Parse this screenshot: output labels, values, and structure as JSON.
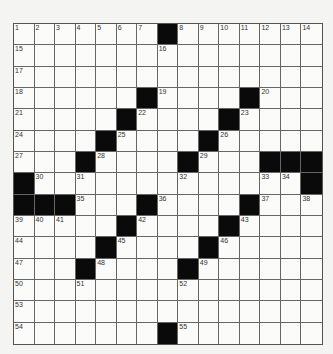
{
  "puzzle": {
    "rows": 15,
    "cols": 15,
    "colors": {
      "black": "#0a0a0a",
      "white": "#fbfbf9",
      "line": "#666666",
      "background": "#f4f4f2"
    },
    "layout": [
      "1234567#8901234",
      "...............",
      "...............",
      "......#....#...",
      ".....#....#....",
      "....#....#.....",
      "...#....#...###",
      "#.............#",
      "###...#....#...",
      ".....#....#....",
      "....#....#.....",
      "...#....#......",
      "...............",
      "...............",
      ".......#......."
    ],
    "blacks": [
      [
        0,
        7
      ],
      [
        3,
        6
      ],
      [
        3,
        11
      ],
      [
        4,
        5
      ],
      [
        4,
        10
      ],
      [
        5,
        4
      ],
      [
        5,
        9
      ],
      [
        6,
        3
      ],
      [
        6,
        8
      ],
      [
        6,
        12
      ],
      [
        6,
        13
      ],
      [
        6,
        14
      ],
      [
        7,
        0
      ],
      [
        7,
        14
      ],
      [
        8,
        0
      ],
      [
        8,
        1
      ],
      [
        8,
        2
      ],
      [
        8,
        6
      ],
      [
        8,
        11
      ],
      [
        9,
        5
      ],
      [
        9,
        10
      ],
      [
        10,
        4
      ],
      [
        10,
        9
      ],
      [
        11,
        3
      ],
      [
        11,
        8
      ],
      [
        14,
        7
      ]
    ],
    "numbers": [
      {
        "r": 0,
        "c": 0,
        "n": "1"
      },
      {
        "r": 0,
        "c": 1,
        "n": "2"
      },
      {
        "r": 0,
        "c": 2,
        "n": "3"
      },
      {
        "r": 0,
        "c": 3,
        "n": "4"
      },
      {
        "r": 0,
        "c": 4,
        "n": "5"
      },
      {
        "r": 0,
        "c": 5,
        "n": "6"
      },
      {
        "r": 0,
        "c": 6,
        "n": "7"
      },
      {
        "r": 0,
        "c": 8,
        "n": "8"
      },
      {
        "r": 0,
        "c": 9,
        "n": "9"
      },
      {
        "r": 0,
        "c": 10,
        "n": "10"
      },
      {
        "r": 0,
        "c": 11,
        "n": "11"
      },
      {
        "r": 0,
        "c": 12,
        "n": "12"
      },
      {
        "r": 0,
        "c": 13,
        "n": "13"
      },
      {
        "r": 0,
        "c": 14,
        "n": "14"
      },
      {
        "r": 1,
        "c": 0,
        "n": "15"
      },
      {
        "r": 1,
        "c": 7,
        "n": "16"
      },
      {
        "r": 2,
        "c": 0,
        "n": "17"
      },
      {
        "r": 3,
        "c": 0,
        "n": "18"
      },
      {
        "r": 3,
        "c": 7,
        "n": "19"
      },
      {
        "r": 3,
        "c": 12,
        "n": "20"
      },
      {
        "r": 4,
        "c": 0,
        "n": "21"
      },
      {
        "r": 4,
        "c": 6,
        "n": "22"
      },
      {
        "r": 4,
        "c": 11,
        "n": "23"
      },
      {
        "r": 5,
        "c": 0,
        "n": "24"
      },
      {
        "r": 5,
        "c": 5,
        "n": "25"
      },
      {
        "r": 5,
        "c": 10,
        "n": "26"
      },
      {
        "r": 6,
        "c": 0,
        "n": "27"
      },
      {
        "r": 6,
        "c": 4,
        "n": "28"
      },
      {
        "r": 6,
        "c": 9,
        "n": "29"
      },
      {
        "r": 7,
        "c": 1,
        "n": "30"
      },
      {
        "r": 7,
        "c": 3,
        "n": "31"
      },
      {
        "r": 7,
        "c": 8,
        "n": "32"
      },
      {
        "r": 7,
        "c": 12,
        "n": "33"
      },
      {
        "r": 7,
        "c": 13,
        "n": "34"
      },
      {
        "r": 8,
        "c": 3,
        "n": "35"
      },
      {
        "r": 8,
        "c": 7,
        "n": "36"
      },
      {
        "r": 8,
        "c": 12,
        "n": "37"
      },
      {
        "r": 8,
        "c": 14,
        "n": "38"
      },
      {
        "r": 9,
        "c": 0,
        "n": "39"
      },
      {
        "r": 9,
        "c": 1,
        "n": "40"
      },
      {
        "r": 9,
        "c": 2,
        "n": "41"
      },
      {
        "r": 9,
        "c": 6,
        "n": "42"
      },
      {
        "r": 9,
        "c": 11,
        "n": "43"
      },
      {
        "r": 10,
        "c": 0,
        "n": "44"
      },
      {
        "r": 10,
        "c": 5,
        "n": "45"
      },
      {
        "r": 10,
        "c": 10,
        "n": "46"
      },
      {
        "r": 11,
        "c": 0,
        "n": "47"
      },
      {
        "r": 11,
        "c": 4,
        "n": "48"
      },
      {
        "r": 11,
        "c": 9,
        "n": "49"
      },
      {
        "r": 12,
        "c": 0,
        "n": "50"
      },
      {
        "r": 12,
        "c": 3,
        "n": "51"
      },
      {
        "r": 12,
        "c": 8,
        "n": "52"
      },
      {
        "r": 13,
        "c": 0,
        "n": "53"
      },
      {
        "r": 14,
        "c": 0,
        "n": "54"
      },
      {
        "r": 14,
        "c": 8,
        "n": "55"
      }
    ]
  }
}
